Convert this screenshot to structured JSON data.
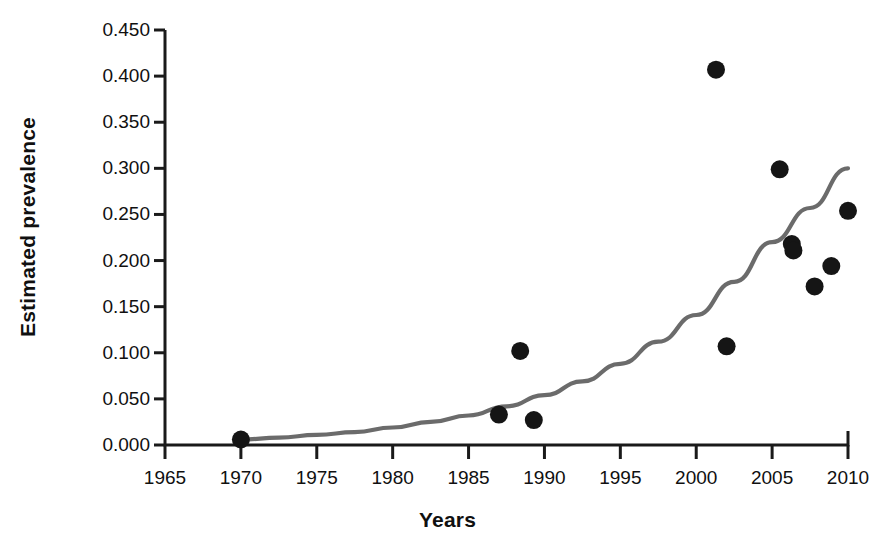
{
  "chart_data": {
    "type": "scatter",
    "title": "",
    "xlabel": "Years",
    "ylabel": "Estimated prevalence",
    "xlim": [
      1965,
      2010
    ],
    "ylim": [
      0.0,
      0.45
    ],
    "grid": false,
    "legend": "none",
    "xticks": [
      1965,
      1970,
      1975,
      1980,
      1985,
      1990,
      1995,
      2000,
      2005,
      2010
    ],
    "xtick_labels": [
      "1965",
      "1970",
      "1975",
      "1980",
      "1985",
      "1990",
      "1995",
      "2000",
      "2005",
      "2010"
    ],
    "yticks": [
      0.0,
      0.05,
      0.1,
      0.15,
      0.2,
      0.25,
      0.3,
      0.35,
      0.4,
      0.45
    ],
    "ytick_labels": [
      "0.000",
      "0.050",
      "0.100",
      "0.150",
      "0.200",
      "0.250",
      "0.300",
      "0.350",
      "0.400",
      "0.450"
    ],
    "series": [
      {
        "name": "Observed prevalence",
        "marker": "filled-circle",
        "color": "#151515",
        "points": [
          {
            "x": 1970.0,
            "y": 0.006
          },
          {
            "x": 1987.0,
            "y": 0.033
          },
          {
            "x": 1988.4,
            "y": 0.102
          },
          {
            "x": 1989.3,
            "y": 0.027
          },
          {
            "x": 2001.3,
            "y": 0.407
          },
          {
            "x": 2002.0,
            "y": 0.107
          },
          {
            "x": 2005.5,
            "y": 0.299
          },
          {
            "x": 2006.3,
            "y": 0.218
          },
          {
            "x": 2006.4,
            "y": 0.211
          },
          {
            "x": 2007.8,
            "y": 0.172
          },
          {
            "x": 2008.9,
            "y": 0.194
          },
          {
            "x": 2010.0,
            "y": 0.254
          }
        ]
      }
    ],
    "fit_curve": {
      "name": "Exponential trend line",
      "color": "#6b6b6b",
      "points": [
        {
          "x": 1970.0,
          "y": 0.006
        },
        {
          "x": 1972.5,
          "y": 0.008
        },
        {
          "x": 1975.0,
          "y": 0.011
        },
        {
          "x": 1977.5,
          "y": 0.014
        },
        {
          "x": 1980.0,
          "y": 0.019
        },
        {
          "x": 1982.5,
          "y": 0.025
        },
        {
          "x": 1985.0,
          "y": 0.032
        },
        {
          "x": 1987.5,
          "y": 0.042
        },
        {
          "x": 1990.0,
          "y": 0.054
        },
        {
          "x": 1992.5,
          "y": 0.069
        },
        {
          "x": 1995.0,
          "y": 0.088
        },
        {
          "x": 1997.5,
          "y": 0.112
        },
        {
          "x": 2000.0,
          "y": 0.141
        },
        {
          "x": 2002.5,
          "y": 0.177
        },
        {
          "x": 2005.0,
          "y": 0.22
        },
        {
          "x": 2007.5,
          "y": 0.257
        },
        {
          "x": 2010.0,
          "y": 0.3
        }
      ]
    }
  },
  "axis": {
    "x_title": "Years",
    "y_title": "Estimated prevalence"
  }
}
